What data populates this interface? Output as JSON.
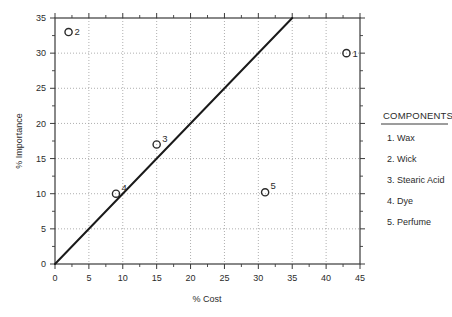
{
  "chart_data": {
    "type": "scatter",
    "title": "",
    "xlabel": "% Cost",
    "ylabel": "% Importance",
    "xlim": [
      0,
      45
    ],
    "ylim": [
      0,
      35
    ],
    "xticks": [
      0,
      5,
      10,
      15,
      20,
      25,
      30,
      35,
      40,
      45
    ],
    "xtick_labels": [
      "0",
      "5",
      "10",
      "15",
      "20",
      "25",
      "30",
      "35",
      "40",
      "45"
    ],
    "yticks": [
      0,
      5,
      10,
      15,
      20,
      25,
      30,
      35
    ],
    "ytick_labels": [
      "0",
      "5",
      "10",
      "15",
      "20",
      "25",
      "30",
      "35"
    ],
    "minor_ticks": true,
    "grid": true,
    "grid_style": "dotted",
    "grid_color": "#999999",
    "marker": "open-circle",
    "marker_color": "#2b2b2b",
    "points": [
      {
        "id": "1",
        "label": "1",
        "x": 43.0,
        "y": 30.0,
        "component": "Wax",
        "label_side": "right"
      },
      {
        "id": "2",
        "label": "2",
        "x": 2.0,
        "y": 33.0,
        "component": "Wick",
        "label_side": "right"
      },
      {
        "id": "3",
        "label": "3",
        "x": 15.0,
        "y": 17.0,
        "component": "Stearic Acid",
        "label_side": "upper-right"
      },
      {
        "id": "4",
        "label": "4",
        "x": 9.0,
        "y": 10.0,
        "component": "Dye",
        "label_side": "upper-right"
      },
      {
        "id": "5",
        "label": "5",
        "x": 31.0,
        "y": 10.2,
        "component": "Perfume",
        "label_side": "upper-right"
      }
    ],
    "reference_line": {
      "name": "diagonal-parity-line",
      "from": [
        0,
        0
      ],
      "to": [
        35,
        35
      ],
      "color": "#1a1a1a",
      "width": 2
    },
    "legend": {
      "position": "right",
      "title": "COMPONENTS",
      "entries": [
        "1. Wax",
        "2. Wick",
        "3. Stearic Acid",
        "4. Dye",
        "5. Perfume"
      ]
    }
  },
  "colors": {
    "axis": "#3a3a3a",
    "grid": "#9a9a9a",
    "line": "#1a1a1a",
    "text": "#2b2b2b",
    "background": "#ffffff"
  }
}
